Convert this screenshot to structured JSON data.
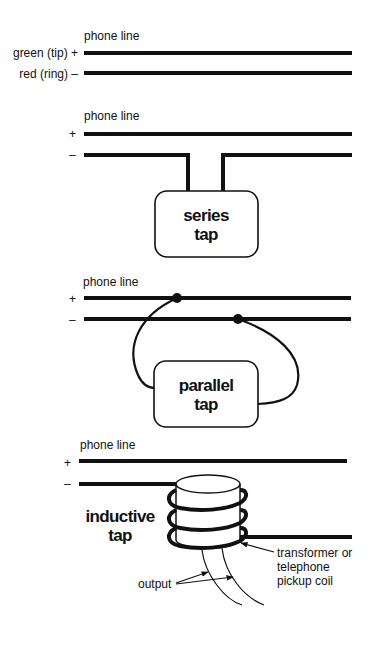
{
  "diagram": {
    "type": "wiretap-methods",
    "panels": [
      {
        "id": "phone-line",
        "title": "phone line",
        "tip_label": "green (tip) +",
        "ring_label": "red (ring) –"
      },
      {
        "id": "series-tap",
        "title": "phone line",
        "plus": "+",
        "minus": "–",
        "box_line1": "series",
        "box_line2": "tap"
      },
      {
        "id": "parallel-tap",
        "title": "phone line",
        "plus": "+",
        "minus": "–",
        "box_line1": "parallel",
        "box_line2": "tap"
      },
      {
        "id": "inductive-tap",
        "title": "phone line",
        "plus": "+",
        "minus": "–",
        "name_line1": "inductive",
        "name_line2": "tap",
        "coil_line1": "transformer or",
        "coil_line2": "telephone",
        "coil_line3": "pickup coil",
        "output_label": "output"
      }
    ],
    "colors": {
      "ink": "#111111",
      "background": "#ffffff"
    }
  }
}
